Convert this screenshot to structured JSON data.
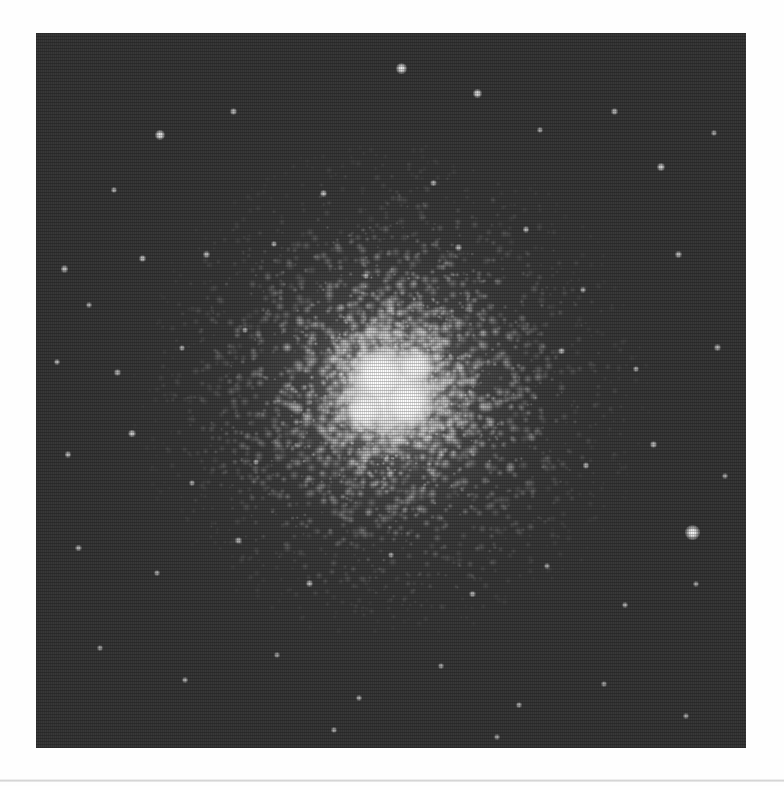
{
  "page": {
    "background_color": "#fefefe",
    "separator_color": "#cecece",
    "caption": ""
  },
  "plate": {
    "name": "globular-cluster-photograph",
    "alt_text": "Grayscale astronomical photograph of a globular star cluster",
    "frame": {
      "x": 36,
      "y": 33,
      "width": 710,
      "height": 715
    },
    "background_color": "#161616",
    "texture": "halftone-scanline",
    "core": {
      "center_x_pct": 50,
      "center_y_pct": 50,
      "peak_color": "#ffffff"
    }
  },
  "chart_data": {
    "type": "scatter",
    "title": "",
    "subtitle": "",
    "xlabel": "",
    "ylabel": "",
    "grid": false,
    "legend_position": "none",
    "xlim": [
      0,
      100
    ],
    "ylim": [
      0,
      100
    ],
    "note": "Star positions as percent of plate width/height; size in px, brightness 0-1",
    "series": [
      {
        "name": "cluster-core-halo",
        "points": [
          {
            "x": 50.0,
            "y": 50.0,
            "r": 44,
            "b": 1.0
          },
          {
            "x": 48.0,
            "y": 47.5,
            "r": 26,
            "b": 0.98
          },
          {
            "x": 52.5,
            "y": 52.0,
            "r": 24,
            "b": 0.95
          },
          {
            "x": 46.0,
            "y": 53.0,
            "r": 20,
            "b": 0.92
          },
          {
            "x": 53.5,
            "y": 46.5,
            "r": 18,
            "b": 0.9
          }
        ]
      },
      {
        "name": "resolved-field-stars",
        "points": [
          {
            "x": 92.4,
            "y": 69.9,
            "r": 7.5,
            "b": 1.0
          },
          {
            "x": 51.5,
            "y": 5.0,
            "r": 5.5,
            "b": 0.95
          },
          {
            "x": 62.2,
            "y": 8.4,
            "r": 4.5,
            "b": 0.88
          },
          {
            "x": 88.0,
            "y": 18.8,
            "r": 4.0,
            "b": 0.82
          },
          {
            "x": 17.5,
            "y": 14.2,
            "r": 5.0,
            "b": 0.92
          },
          {
            "x": 11.0,
            "y": 22.0,
            "r": 3.2,
            "b": 0.7
          },
          {
            "x": 27.8,
            "y": 11.0,
            "r": 3.4,
            "b": 0.72
          },
          {
            "x": 40.5,
            "y": 22.5,
            "r": 3.6,
            "b": 0.75
          },
          {
            "x": 56.0,
            "y": 21.0,
            "r": 3.2,
            "b": 0.68
          },
          {
            "x": 71.0,
            "y": 13.5,
            "r": 3.0,
            "b": 0.66
          },
          {
            "x": 81.5,
            "y": 11.0,
            "r": 3.4,
            "b": 0.7
          },
          {
            "x": 95.5,
            "y": 14.0,
            "r": 3.0,
            "b": 0.64
          },
          {
            "x": 4.0,
            "y": 33.0,
            "r": 3.6,
            "b": 0.74
          },
          {
            "x": 7.5,
            "y": 38.0,
            "r": 3.0,
            "b": 0.66
          },
          {
            "x": 15.0,
            "y": 31.5,
            "r": 3.6,
            "b": 0.76
          },
          {
            "x": 24.0,
            "y": 31.0,
            "r": 3.2,
            "b": 0.7
          },
          {
            "x": 33.5,
            "y": 29.5,
            "r": 3.2,
            "b": 0.68
          },
          {
            "x": 46.5,
            "y": 34.0,
            "r": 3.0,
            "b": 0.66
          },
          {
            "x": 59.5,
            "y": 30.0,
            "r": 3.2,
            "b": 0.68
          },
          {
            "x": 69.0,
            "y": 27.5,
            "r": 3.4,
            "b": 0.72
          },
          {
            "x": 77.0,
            "y": 36.0,
            "r": 3.0,
            "b": 0.64
          },
          {
            "x": 90.5,
            "y": 31.0,
            "r": 3.4,
            "b": 0.72
          },
          {
            "x": 3.0,
            "y": 46.0,
            "r": 3.2,
            "b": 0.7
          },
          {
            "x": 11.5,
            "y": 47.5,
            "r": 3.2,
            "b": 0.68
          },
          {
            "x": 20.5,
            "y": 44.0,
            "r": 3.0,
            "b": 0.66
          },
          {
            "x": 29.5,
            "y": 41.5,
            "r": 3.0,
            "b": 0.64
          },
          {
            "x": 74.0,
            "y": 44.5,
            "r": 3.2,
            "b": 0.68
          },
          {
            "x": 84.5,
            "y": 47.0,
            "r": 3.0,
            "b": 0.66
          },
          {
            "x": 96.0,
            "y": 44.0,
            "r": 3.2,
            "b": 0.68
          },
          {
            "x": 4.5,
            "y": 59.0,
            "r": 3.4,
            "b": 0.72
          },
          {
            "x": 13.5,
            "y": 56.0,
            "r": 3.8,
            "b": 0.8
          },
          {
            "x": 22.0,
            "y": 63.0,
            "r": 3.0,
            "b": 0.64
          },
          {
            "x": 31.0,
            "y": 60.0,
            "r": 3.0,
            "b": 0.62
          },
          {
            "x": 77.5,
            "y": 60.5,
            "r": 3.2,
            "b": 0.68
          },
          {
            "x": 87.0,
            "y": 57.5,
            "r": 3.4,
            "b": 0.72
          },
          {
            "x": 97.0,
            "y": 62.0,
            "r": 3.0,
            "b": 0.62
          },
          {
            "x": 6.0,
            "y": 72.0,
            "r": 3.2,
            "b": 0.68
          },
          {
            "x": 17.0,
            "y": 75.5,
            "r": 3.0,
            "b": 0.64
          },
          {
            "x": 28.5,
            "y": 71.0,
            "r": 3.2,
            "b": 0.68
          },
          {
            "x": 38.5,
            "y": 77.0,
            "r": 3.4,
            "b": 0.72
          },
          {
            "x": 50.0,
            "y": 73.0,
            "r": 3.0,
            "b": 0.62
          },
          {
            "x": 61.5,
            "y": 78.5,
            "r": 3.2,
            "b": 0.68
          },
          {
            "x": 72.0,
            "y": 74.5,
            "r": 3.0,
            "b": 0.62
          },
          {
            "x": 83.0,
            "y": 80.0,
            "r": 3.2,
            "b": 0.66
          },
          {
            "x": 93.0,
            "y": 77.0,
            "r": 3.0,
            "b": 0.62
          },
          {
            "x": 9.0,
            "y": 86.0,
            "r": 3.0,
            "b": 0.62
          },
          {
            "x": 21.0,
            "y": 90.5,
            "r": 3.2,
            "b": 0.66
          },
          {
            "x": 34.0,
            "y": 87.0,
            "r": 3.0,
            "b": 0.6
          },
          {
            "x": 45.5,
            "y": 93.0,
            "r": 3.2,
            "b": 0.66
          },
          {
            "x": 57.0,
            "y": 88.5,
            "r": 3.0,
            "b": 0.62
          },
          {
            "x": 68.0,
            "y": 94.0,
            "r": 3.2,
            "b": 0.66
          },
          {
            "x": 80.0,
            "y": 91.0,
            "r": 3.0,
            "b": 0.6
          },
          {
            "x": 91.5,
            "y": 95.5,
            "r": 3.0,
            "b": 0.62
          },
          {
            "x": 42.0,
            "y": 97.5,
            "r": 3.2,
            "b": 0.66
          },
          {
            "x": 65.0,
            "y": 98.5,
            "r": 3.0,
            "b": 0.6
          }
        ]
      }
    ]
  }
}
